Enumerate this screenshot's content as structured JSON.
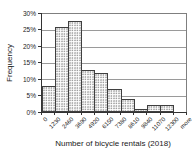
{
  "chart_data": {
    "type": "bar",
    "subtype": "histogram",
    "title": "",
    "xlabel": "Number of bicycle rentals (2018)",
    "ylabel": "Frequency",
    "bin_edge_labels": [
      "0",
      "1230",
      "2460",
      "3690",
      "4920",
      "6150",
      "7380",
      "8610",
      "9840",
      "11070",
      "12300",
      "more"
    ],
    "values": [
      8,
      26,
      28,
      13,
      12,
      7,
      4,
      1,
      2,
      2,
      0
    ],
    "value_unit": "%",
    "ylim": [
      0,
      30
    ],
    "ytick_step": 5,
    "ytick_labels": [
      "0%",
      "5%",
      "10%",
      "15%",
      "20%",
      "25%",
      "30%"
    ],
    "grid": true,
    "legend": false,
    "colors": {
      "bar_fill": "#ffffff",
      "bar_dot_pattern": "#8c8c8c",
      "bar_border": "#3f3f3f",
      "gridline": "#9a9a9a",
      "axis": "#333333",
      "text": "#1a1a1a",
      "background": "#ffffff"
    }
  }
}
